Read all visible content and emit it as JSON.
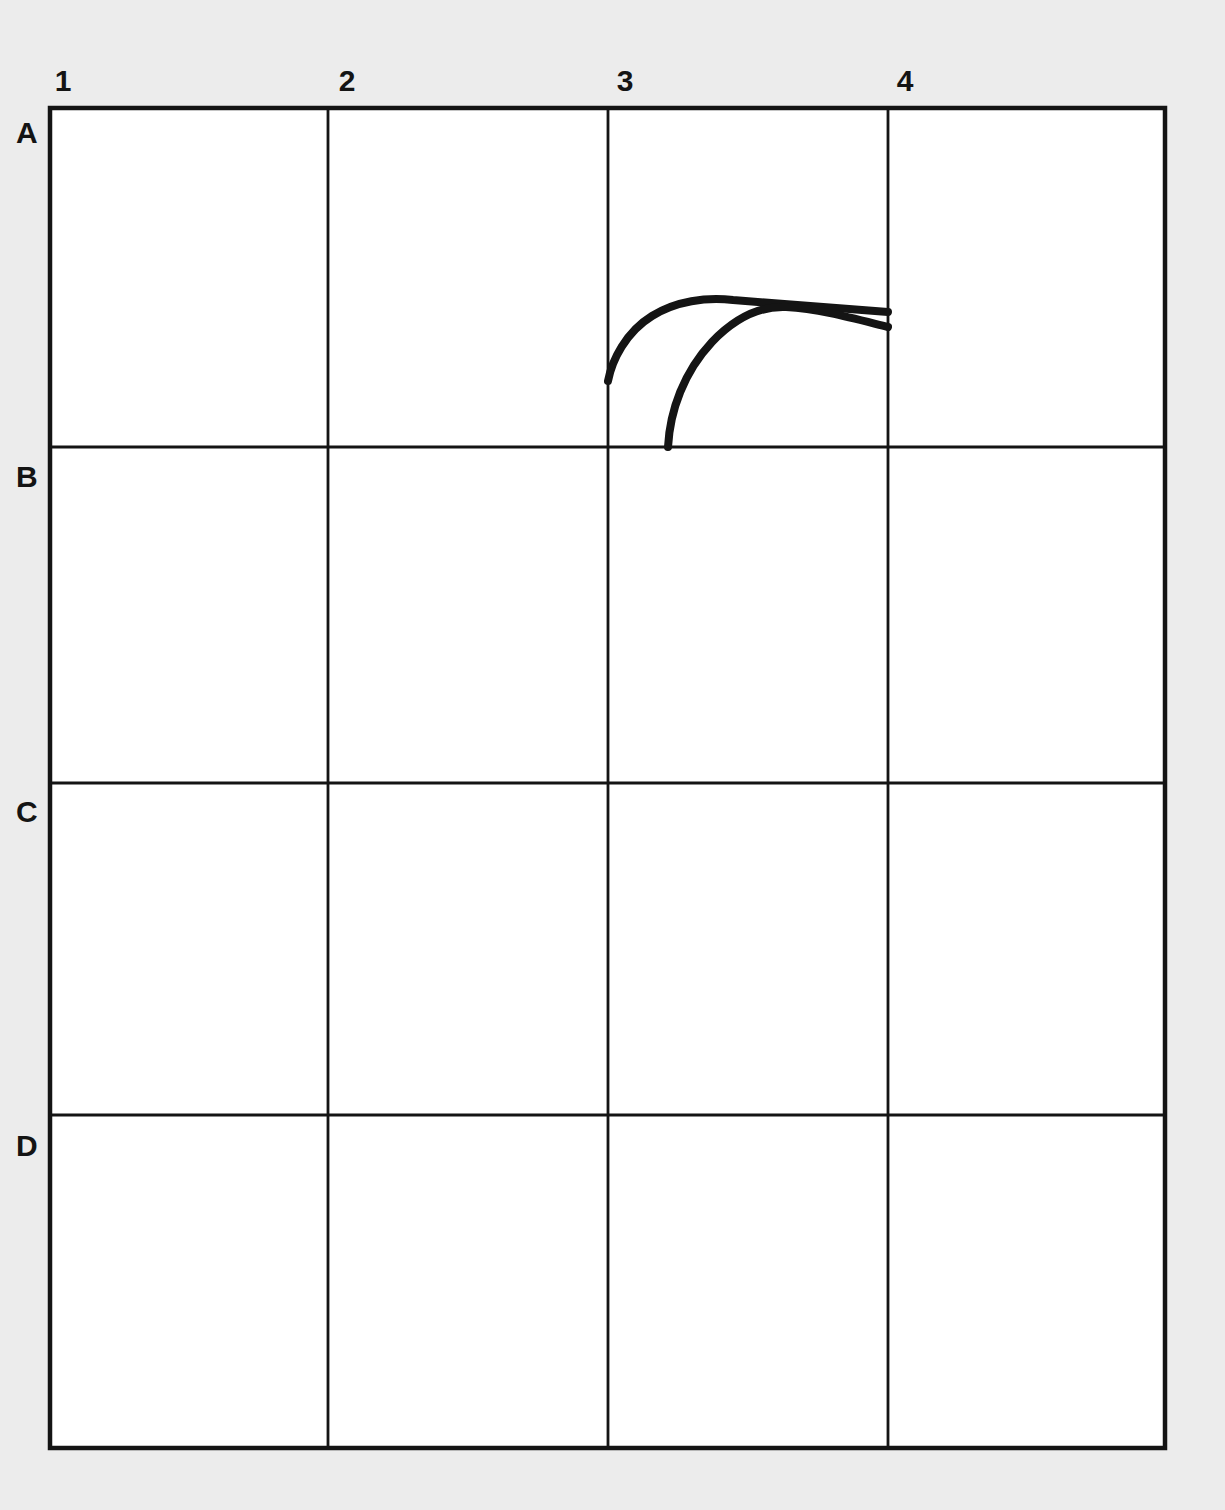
{
  "figure": {
    "title": "",
    "background_color": "#ececec",
    "plate_color": "#ffffff",
    "line_color": "#141414",
    "curve_color": "#141414",
    "grid": {
      "columns": [
        "1",
        "2",
        "3",
        "4"
      ],
      "rows": [
        "A",
        "B",
        "C",
        "D"
      ],
      "column_label_positions_px": [
        189,
        468,
        748,
        1026
      ],
      "column_tick_label_x_px": [
        63,
        347,
        625,
        905
      ],
      "row_label_positions_px": [
        130,
        475,
        810,
        1145
      ],
      "vertical_line_x_px": [
        50,
        328,
        608,
        888,
        1165
      ],
      "horizontal_line_y_px": [
        108,
        447,
        783,
        1115,
        1448
      ],
      "outer_border_px": {
        "left": 50,
        "top": 108,
        "right": 1165,
        "bottom": 1448
      },
      "outer_border_width_px": 4,
      "inner_line_width_px": 2.6
    },
    "cells_with_content": [
      "A3",
      "A4"
    ],
    "curves": [
      {
        "name": "upper-arc",
        "label": "",
        "stroke_width_px": 8,
        "start_px": [
          608,
          381
        ],
        "end_px": [
          888,
          312
        ],
        "peak_px": [
          733,
          300
        ],
        "path": "M 608 381 C 612 360 626 332 652 316 C 676 301 706 297 733 300 C 772 303 824 307 888 312"
      },
      {
        "name": "lower-arc",
        "label": "",
        "stroke_width_px": 8,
        "start_px": [
          668,
          447
        ],
        "end_px": [
          888,
          327
        ],
        "crossing_px": [
          786,
          307
        ],
        "path": "M 668 447 C 670 410 684 372 712 342 C 736 317 762 306 786 307 C 820 309 852 318 888 327"
      }
    ],
    "column_labels": [
      {
        "text": "1",
        "x": 63,
        "y": 88
      },
      {
        "text": "2",
        "x": 347,
        "y": 88
      },
      {
        "text": "3",
        "x": 625,
        "y": 88
      },
      {
        "text": "4",
        "x": 905,
        "y": 88
      }
    ],
    "row_labels": [
      {
        "text": "A",
        "x": 25,
        "y": 133
      },
      {
        "text": "B",
        "x": 25,
        "y": 477
      },
      {
        "text": "C",
        "x": 25,
        "y": 812
      },
      {
        "text": "D",
        "x": 25,
        "y": 1146
      }
    ]
  },
  "chart_data": {
    "type": "line",
    "title": "",
    "xlabel": "",
    "ylabel": "",
    "grid": true,
    "legend": "none",
    "x_categories": [
      "1",
      "2",
      "3",
      "4"
    ],
    "y_categories": [
      "A",
      "B",
      "C",
      "D"
    ],
    "annotations": [],
    "series": [
      {
        "name": "upper-arc",
        "points_px": [
          [
            608,
            381
          ],
          [
            625,
            350
          ],
          [
            652,
            316
          ],
          [
            690,
            300
          ],
          [
            733,
            300
          ],
          [
            786,
            305
          ],
          [
            840,
            309
          ],
          [
            888,
            312
          ]
        ]
      },
      {
        "name": "lower-arc",
        "points_px": [
          [
            668,
            447
          ],
          [
            672,
            412
          ],
          [
            690,
            372
          ],
          [
            712,
            342
          ],
          [
            748,
            316
          ],
          [
            786,
            307
          ],
          [
            840,
            318
          ],
          [
            888,
            327
          ]
        ]
      }
    ]
  }
}
